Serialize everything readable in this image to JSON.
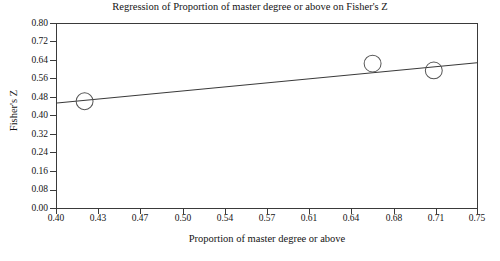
{
  "chart_data": {
    "type": "scatter",
    "title": "Regression of Proportion of master degree or above on Fisher's Z",
    "xlabel": "Proportion of master degree or above",
    "ylabel": "Fisher's Z",
    "xlim": [
      0.4,
      0.75
    ],
    "ylim": [
      0.0,
      0.8
    ],
    "grid": false,
    "legend": false,
    "xticks": [
      0.4,
      0.43,
      0.47,
      0.5,
      0.54,
      0.57,
      0.61,
      0.64,
      0.68,
      0.71,
      0.75
    ],
    "xtick_labels": [
      "0.40",
      "0.43",
      "0.47",
      "0.50",
      "0.54",
      "0.57",
      "0.61",
      "0.64",
      "0.68",
      "0.71",
      "0.75"
    ],
    "yticks": [
      0.0,
      0.08,
      0.16,
      0.24,
      0.32,
      0.4,
      0.48,
      0.56,
      0.64,
      0.72,
      0.8
    ],
    "ytick_labels": [
      "0.00",
      "0.08",
      "0.16",
      "0.24",
      "0.32",
      "0.40",
      "0.48",
      "0.56",
      "0.64",
      "0.72",
      "0.80"
    ],
    "points": [
      {
        "x": 0.423,
        "y": 0.464
      },
      {
        "x": 0.663,
        "y": 0.628
      },
      {
        "x": 0.714,
        "y": 0.598
      }
    ],
    "series": [
      {
        "name": "observations",
        "marker": "open-circle",
        "x": [
          0.423,
          0.663,
          0.714
        ],
        "values": [
          0.464,
          0.628,
          0.598
        ]
      },
      {
        "name": "regression-line",
        "type": "line",
        "x": [
          0.4,
          0.75
        ],
        "values": [
          0.456,
          0.632
        ]
      }
    ],
    "colors": {
      "axis": "#3a3a3a",
      "marker_stroke": "#555555",
      "line": "#3a3a3a",
      "text": "#141414",
      "background": "#ffffff"
    }
  }
}
